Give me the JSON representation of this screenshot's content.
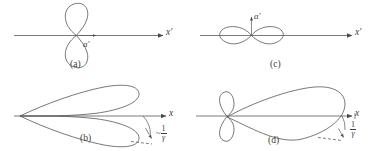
{
  "figure": {
    "title": "",
    "panels": [
      {
        "id": "a",
        "tag": "(a)",
        "axis_label": "x′",
        "vector_label": "a′",
        "vector_direction": "along-axis",
        "pattern": "vertical-figure-eight",
        "description": "Dipole radiation pattern perpendicular to the acceleration which is parallel to x-prime"
      },
      {
        "id": "b",
        "tag": "(b)",
        "axis_label": "x",
        "angle_label_tilde": "~",
        "angle_label_numerator": "1",
        "angle_label_denominator": "γ",
        "pattern": "two-forward-lobes",
        "description": "Lab frame pattern, forward beamed twin lobes with opening angle about one over gamma"
      },
      {
        "id": "c",
        "tag": "(c)",
        "axis_label": "x′",
        "vector_label": "a′",
        "vector_direction": "perpendicular-up",
        "pattern": "horizontal-figure-eight",
        "description": "Dipole radiation pattern for acceleration perpendicular to x-prime"
      },
      {
        "id": "d",
        "tag": "(d)",
        "axis_label": "x",
        "angle_label_numerator": "1",
        "angle_label_denominator": "γ",
        "pattern": "single-forward-lobe-with-back-lobes",
        "description": "Lab frame pattern, single large forward lobe with small backward lobes and opening angle one over gamma"
      }
    ],
    "colors": {
      "stroke": "#4a4a4a",
      "curve": "#555555",
      "axis": "#6b6b6b",
      "text": "#3d3d3d",
      "background": "#ffffff"
    }
  }
}
